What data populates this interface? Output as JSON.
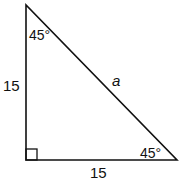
{
  "figure": {
    "type": "right-triangle",
    "angles": {
      "top": "45°",
      "bottom_right": "45°",
      "bottom_left": "right-angle"
    },
    "sides": {
      "vertical_leg": "15",
      "horizontal_leg": "15",
      "hypotenuse": "a"
    },
    "colors": {
      "stroke": "#111111",
      "background": "#ffffff"
    }
  }
}
